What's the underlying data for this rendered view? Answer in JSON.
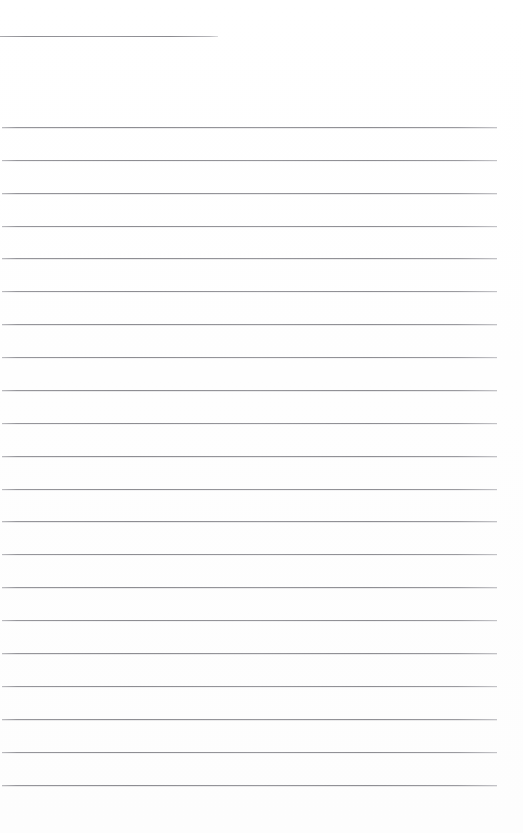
{
  "document": {
    "kind": "scanned-ruled-page",
    "page_width": 523,
    "page_height": 833,
    "background_color": "#ffffff",
    "rule_color": "#8e8e93",
    "text_content": "",
    "visible_text_lines": [],
    "notes_label": ""
  },
  "heading_rule": {
    "name": "heading-underline",
    "x": 0,
    "y": 36,
    "width": 218,
    "height": 1
  },
  "body_rules": {
    "count": 21,
    "left": 2,
    "right": 497,
    "width": 495,
    "first_y": 127,
    "spacing": 32.9,
    "height": 1,
    "y_positions": [
      127,
      160,
      193,
      226,
      258,
      291,
      324,
      357,
      390,
      423,
      456,
      489,
      521,
      554,
      587,
      620,
      653,
      686,
      719,
      752,
      785
    ]
  }
}
